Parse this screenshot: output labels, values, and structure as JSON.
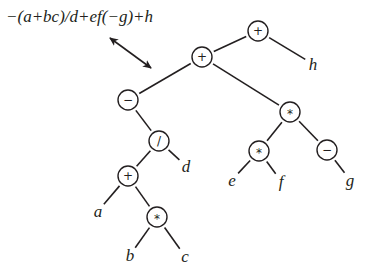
{
  "diagram": {
    "type": "expression-tree",
    "expression": "−(a+bc)/d+ef(−g)+h",
    "colors": {
      "ink": "#231f20",
      "background": "#ffffff"
    },
    "nodes": [
      {
        "id": "n1",
        "kind": "operator",
        "label": "+",
        "x": 258,
        "y": 31
      },
      {
        "id": "n2",
        "kind": "operator",
        "label": "+",
        "x": 202,
        "y": 57
      },
      {
        "id": "n3",
        "kind": "leaf",
        "label": "h",
        "x": 313,
        "y": 64
      },
      {
        "id": "n4",
        "kind": "operator",
        "label": "−",
        "x": 128,
        "y": 100
      },
      {
        "id": "n5",
        "kind": "operator",
        "label": "*",
        "x": 290,
        "y": 112
      },
      {
        "id": "n6",
        "kind": "operator",
        "label": "/",
        "x": 159,
        "y": 141
      },
      {
        "id": "n7",
        "kind": "leaf",
        "label": "d",
        "x": 186,
        "y": 166
      },
      {
        "id": "n8",
        "kind": "operator",
        "label": "*",
        "x": 259,
        "y": 151
      },
      {
        "id": "n9",
        "kind": "operator",
        "label": "−",
        "x": 327,
        "y": 150
      },
      {
        "id": "n10",
        "kind": "leaf",
        "label": "e",
        "x": 232,
        "y": 180
      },
      {
        "id": "n11",
        "kind": "leaf",
        "label": "f",
        "x": 281,
        "y": 181
      },
      {
        "id": "n12",
        "kind": "leaf",
        "label": "g",
        "x": 350,
        "y": 180
      },
      {
        "id": "n13",
        "kind": "operator",
        "label": "+",
        "x": 128,
        "y": 176
      },
      {
        "id": "n14",
        "kind": "leaf",
        "label": "a",
        "x": 98,
        "y": 211
      },
      {
        "id": "n15",
        "kind": "operator",
        "label": "*",
        "x": 157,
        "y": 217
      },
      {
        "id": "n16",
        "kind": "leaf",
        "label": "b",
        "x": 130,
        "y": 255
      },
      {
        "id": "n17",
        "kind": "leaf",
        "label": "c",
        "x": 185,
        "y": 256
      }
    ],
    "edges": [
      [
        "n1",
        "n2"
      ],
      [
        "n1",
        "n3"
      ],
      [
        "n2",
        "n4"
      ],
      [
        "n2",
        "n5"
      ],
      [
        "n4",
        "n6"
      ],
      [
        "n6",
        "n13"
      ],
      [
        "n6",
        "n7"
      ],
      [
        "n13",
        "n14"
      ],
      [
        "n13",
        "n15"
      ],
      [
        "n15",
        "n16"
      ],
      [
        "n15",
        "n17"
      ],
      [
        "n5",
        "n8"
      ],
      [
        "n5",
        "n9"
      ],
      [
        "n8",
        "n10"
      ],
      [
        "n8",
        "n11"
      ],
      [
        "n9",
        "n12"
      ]
    ],
    "arrow": {
      "x1": 110,
      "y1": 38,
      "x2": 151,
      "y2": 68,
      "double_headed": true
    }
  }
}
